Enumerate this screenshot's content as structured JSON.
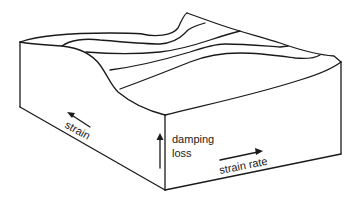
{
  "diagram": {
    "type": "3d-surface-block",
    "labels": {
      "strain": "strain",
      "damping_line1": "damping",
      "damping_line2": "loss",
      "strain_rate": "strain rate"
    },
    "axes": [
      {
        "name": "strain",
        "direction": "toward back-left"
      },
      {
        "name": "damping loss",
        "direction": "up"
      },
      {
        "name": "strain rate",
        "direction": "toward right"
      }
    ],
    "colors": {
      "stroke": "#1a1a1a",
      "background": "#ffffff"
    }
  }
}
